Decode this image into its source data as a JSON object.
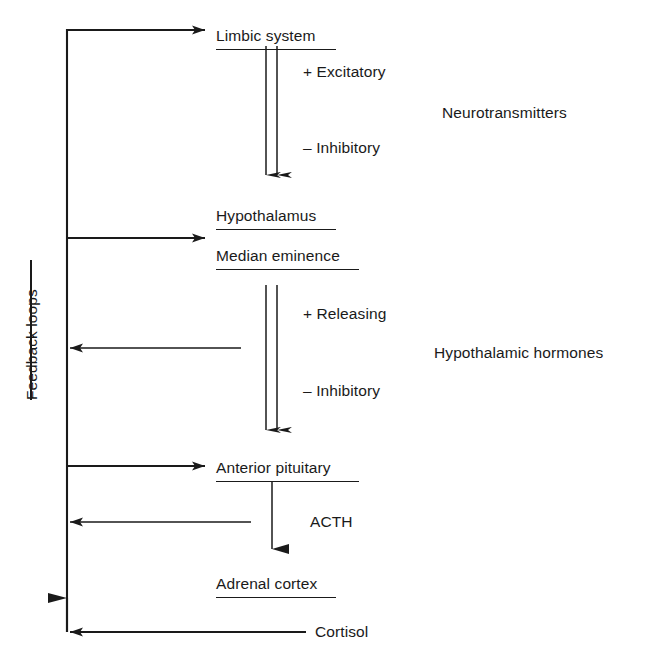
{
  "diagram": {
    "colors": {
      "ink": "#1a1a1a",
      "background": "#ffffff"
    },
    "group_label": "Feedback loops",
    "nodes": [
      {
        "id": "limbic",
        "label": "Limbic system",
        "x": 216,
        "y": 28,
        "underline_width": 120
      },
      {
        "id": "hypo",
        "label": "Hypothalamus",
        "x": 216,
        "y": 208,
        "underline_width": 120
      },
      {
        "id": "median",
        "label": "Median eminence",
        "x": 216,
        "y": 248,
        "underline_width": 143
      },
      {
        "id": "pituit",
        "label": "Anterior pituitary",
        "x": 216,
        "y": 460,
        "underline_width": 143
      },
      {
        "id": "adrenal",
        "label": "Adrenal cortex",
        "x": 216,
        "y": 576,
        "underline_width": 120
      }
    ],
    "edge_labels": [
      {
        "id": "excitatory-1",
        "label": "+ Excitatory",
        "x": 303,
        "y": 64
      },
      {
        "id": "inhibitory-1",
        "label": "– Inhibitory",
        "x": 303,
        "y": 140
      },
      {
        "id": "releasing",
        "label": "+ Releasing",
        "x": 303,
        "y": 306
      },
      {
        "id": "inhibitory-2",
        "label": "– Inhibitory",
        "x": 303,
        "y": 383
      },
      {
        "id": "acth",
        "label": "ACTH",
        "x": 310,
        "y": 514
      },
      {
        "id": "cortisol",
        "label": "Cortisol",
        "x": 315,
        "y": 624
      }
    ],
    "side_labels": [
      {
        "id": "neurotransmitters",
        "label": "Neurotransmitters",
        "x": 442,
        "y": 105
      },
      {
        "id": "hypothalamic-hormones",
        "label": "Hypothalamic hormones",
        "x": 434,
        "y": 345
      }
    ]
  }
}
